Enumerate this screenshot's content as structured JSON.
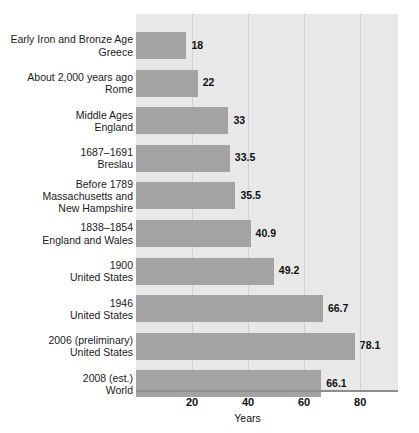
{
  "chart_data": {
    "type": "bar",
    "orientation": "horizontal",
    "title": "",
    "xlabel": "Years",
    "ylabel": "",
    "xlim": [
      0,
      93.5
    ],
    "grid": true,
    "gridlines_at": [
      20,
      40,
      60,
      80
    ],
    "xticks": [
      "20",
      "40",
      "60",
      "80"
    ],
    "legend": "none",
    "categories": [
      "Early Iron and Bronze Age\nGreece",
      "About 2,000 years ago\nRome",
      "Middle Ages\nEngland",
      "1687–1691\nBreslau",
      "Before 1789\nMassachusetts and\nNew Hampshire",
      "1838–1854\nEngland and Wales",
      "1900\nUnited States",
      "1946\nUnited States",
      "2006 (preliminary)\nUnited States",
      "2008 (est.)\nWorld"
    ],
    "values": [
      18,
      22,
      33,
      33.5,
      35.5,
      40.9,
      49.2,
      66.7,
      78.1,
      66.1
    ],
    "value_labels": [
      "18",
      "22",
      "33",
      "33.5",
      "35.5",
      "40.9",
      "49.2",
      "66.7",
      "78.1",
      "66.1"
    ],
    "colors": {
      "bar": "#a3a3a3",
      "plot_background": "#e8e8e8",
      "gridline": "#d2d2d2",
      "axis_line": "#8d8d8d",
      "page_background": "#ffffff",
      "text": "#1a1a1a"
    }
  }
}
